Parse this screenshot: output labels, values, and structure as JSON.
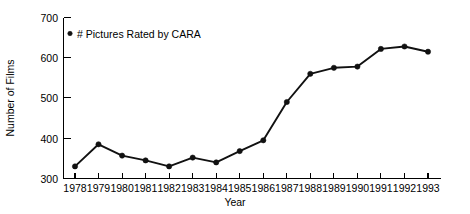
{
  "chart_data": {
    "type": "line",
    "title": "",
    "xlabel": "Year",
    "ylabel": "Number of Films",
    "categories": [
      "1978",
      "1979",
      "1980",
      "1981",
      "1982",
      "1983",
      "1984",
      "1985",
      "1986",
      "1987",
      "1988",
      "1989",
      "1990",
      "1991",
      "1992",
      "1993"
    ],
    "series": [
      {
        "name": "# Pictures Rated by CARA",
        "values": [
          330,
          385,
          357,
          345,
          330,
          352,
          340,
          368,
          395,
          490,
          560,
          575,
          578,
          622,
          628,
          615
        ]
      }
    ],
    "xticklabels": [
      "1978",
      "1979",
      "1980",
      "1981",
      "1982",
      "1983",
      "1984",
      "1985",
      "1986",
      "1987",
      "1988",
      "1989",
      "1990",
      "1991",
      "1992",
      "1993"
    ],
    "yticklabels": [
      "300",
      "400",
      "500",
      "600",
      "700"
    ],
    "yticks": [
      300,
      400,
      500,
      600,
      700
    ],
    "ylim": [
      300,
      700
    ],
    "grid": "off",
    "legend_position": "top-left-inside",
    "marker": "filled-circle",
    "line_color": "#111111",
    "background_color": "#ffffff"
  },
  "legend": {
    "entries": [
      {
        "label": "# Pictures Rated by CARA",
        "marker": "dot-marker"
      }
    ]
  },
  "axes": {
    "y_title": "Number of Films",
    "x_title": "Year"
  }
}
